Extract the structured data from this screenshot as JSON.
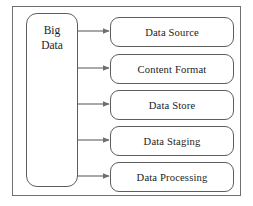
{
  "diagram": {
    "type": "flow-diagram",
    "frame": {
      "name": "outer-frame",
      "border_color": "#6f6f6f",
      "background": "#ffffff"
    },
    "source_node": {
      "id": "big-data",
      "label": "Big Data",
      "label_lines": [
        "Big",
        "Data"
      ],
      "shape": "rounded-rectangle",
      "border_color": "#5e5e5e",
      "fill": "#ffffff"
    },
    "stages": [
      {
        "id": "data-source",
        "label": "Data Source"
      },
      {
        "id": "content-format",
        "label": "Content Format"
      },
      {
        "id": "data-store",
        "label": "Data Store"
      },
      {
        "id": "data-staging",
        "label": "Data Staging"
      },
      {
        "id": "data-processing",
        "label": "Data Processing"
      }
    ],
    "connectors": {
      "count": 5,
      "style": "solid-line-with-filled-arrowhead",
      "direction": "left-to-right",
      "color": "#6f6f6f"
    },
    "colors": {
      "line": "#6f6f6f",
      "node_border": "#5e5e5e",
      "text": "#1c1c1c",
      "background": "#ffffff"
    }
  }
}
